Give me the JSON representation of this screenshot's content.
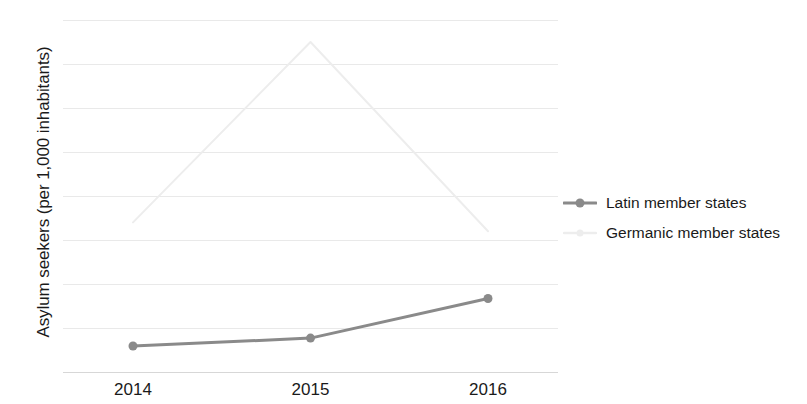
{
  "chart_data": {
    "type": "line",
    "title": "",
    "xlabel": "",
    "ylabel": "Asylum seekers (per 1,000 inhabitants)",
    "categories": [
      "2014",
      "2015",
      "2016"
    ],
    "x": [
      2014,
      2015,
      2016
    ],
    "ylim": [
      0,
      8
    ],
    "yticks": [
      0,
      1,
      2,
      3,
      4,
      5,
      6,
      7,
      8
    ],
    "ytick_labels": [
      "0",
      "1",
      "2",
      "3",
      "4",
      "5",
      "6",
      "7",
      "8"
    ],
    "grid": true,
    "legend_position": "right",
    "series": [
      {
        "name": "Latin member states",
        "values": [
          0.59,
          0.77,
          1.67
        ],
        "color": "#8a8a8a",
        "marker": "circle",
        "line_width": 3
      },
      {
        "name": "Germanic member states",
        "values": [
          3.4,
          7.5,
          3.2
        ],
        "color": "#ededed",
        "marker": "none",
        "line_width": 2
      }
    ]
  },
  "legend": {
    "items": [
      {
        "label": "Latin member states",
        "color": "#8a8a8a",
        "marker": "circle"
      },
      {
        "label": "Germanic member states",
        "color": "#ededed",
        "marker": "none"
      }
    ]
  },
  "colors": {
    "background": "#ffffff",
    "gridline": "#e9e9e9",
    "axis": "#d7d7d7",
    "text": "#1a1a1a",
    "latin": "#8a8a8a",
    "germanic": "#ededed"
  }
}
